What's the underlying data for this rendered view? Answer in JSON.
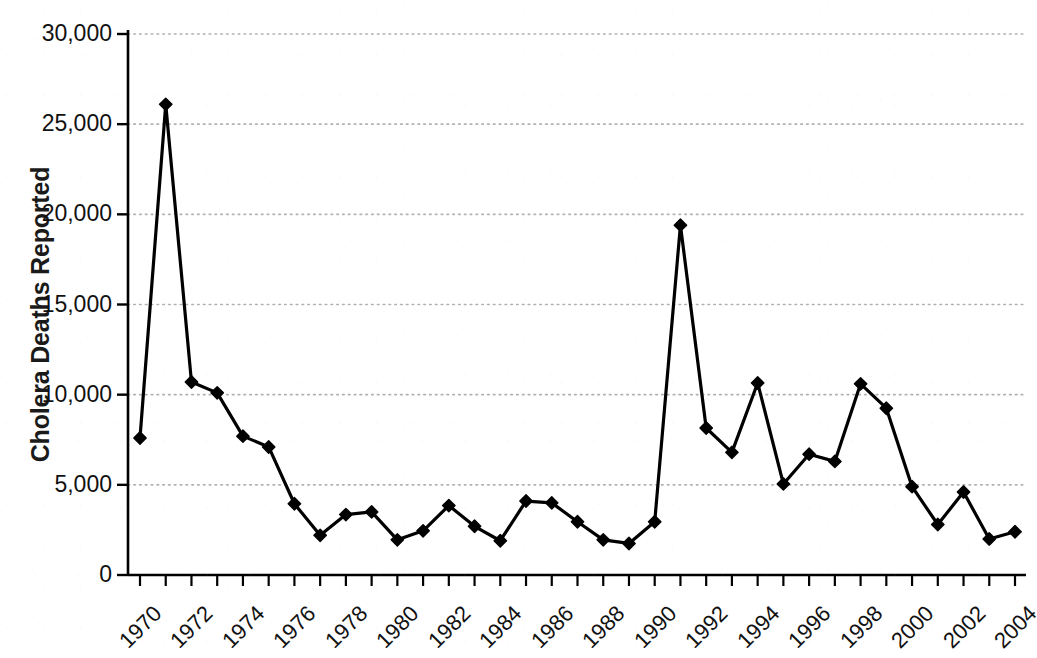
{
  "chart_data": {
    "type": "line",
    "title": "",
    "subtitle": "",
    "xlabel": "",
    "ylabel": "Cholera Deaths Reported",
    "xlim": [
      1970,
      2004
    ],
    "ylim": [
      0,
      30000
    ],
    "grid": true,
    "grid_axis": "y",
    "legend": false,
    "legend_position": "none",
    "marker": "diamond",
    "line_color": "#000000",
    "marker_color": "#000000",
    "grid_color": "#b0b0b0",
    "axis_color": "#000000",
    "background_color": "#ffffff",
    "y_ticks": [
      0,
      5000,
      10000,
      15000,
      20000,
      25000,
      30000
    ],
    "y_tick_labels": [
      "0",
      "5,000",
      "10,000",
      "15,000",
      "20,000",
      "25,000",
      "30,000"
    ],
    "x_tick_labels": [
      "1970",
      "1972",
      "1974",
      "1976",
      "1978",
      "1980",
      "1982",
      "1984",
      "1986",
      "1988",
      "1990",
      "1992",
      "1994",
      "1996",
      "1998",
      "2000",
      "2002",
      "2004"
    ],
    "x_tick_label_rotation": -45,
    "x": [
      1970,
      1971,
      1972,
      1973,
      1974,
      1975,
      1976,
      1977,
      1978,
      1979,
      1980,
      1981,
      1982,
      1983,
      1984,
      1985,
      1986,
      1987,
      1988,
      1989,
      1990,
      1991,
      1992,
      1993,
      1994,
      1995,
      1996,
      1997,
      1998,
      1999,
      2000,
      2001,
      2002,
      2003,
      2004
    ],
    "series": [
      {
        "name": "Cholera Deaths Reported",
        "values": [
          7600,
          26100,
          10700,
          10100,
          7700,
          7100,
          3950,
          2200,
          3350,
          3500,
          1950,
          2450,
          3850,
          2700,
          1900,
          4100,
          4000,
          2950,
          1950,
          1750,
          2950,
          19400,
          8150,
          6800,
          10650,
          5050,
          6700,
          6300,
          10600,
          9250,
          4900,
          2800,
          4600,
          2000,
          2400
        ]
      }
    ]
  },
  "axes": {
    "y_title": "Cholera Deaths Reported"
  }
}
